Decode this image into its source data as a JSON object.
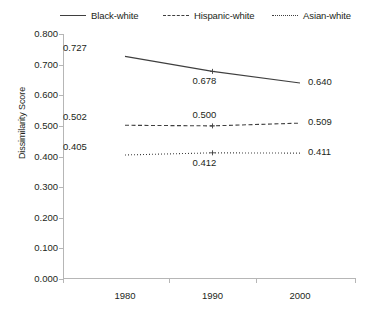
{
  "chart_data": {
    "type": "line",
    "title": "",
    "xlabel": "",
    "ylabel": "Dissimilarity Score",
    "categories": [
      "1980",
      "1990",
      "2000"
    ],
    "ylim": [
      0.0,
      0.8
    ],
    "ytick_labels": [
      "0.800",
      "0.700",
      "0.600",
      "0.500",
      "0.400",
      "0.300",
      "0.200",
      "0.100",
      "0.000"
    ],
    "ytick_values": [
      0.8,
      0.7,
      0.6,
      0.5,
      0.4,
      0.3,
      0.2,
      0.1,
      0.0
    ],
    "grid": false,
    "legend_position": "top",
    "series": [
      {
        "name": "Black-white",
        "style": "solid",
        "color": "#3f3f3f",
        "values": [
          0.727,
          0.678,
          0.64
        ],
        "labels": [
          "0.727",
          "0.678",
          "0.640"
        ]
      },
      {
        "name": "Hispanic-white",
        "style": "dashed",
        "color": "#3f3f3f",
        "values": [
          0.502,
          0.5,
          0.509
        ],
        "labels": [
          "0.502",
          "0.500",
          "0.509"
        ]
      },
      {
        "name": "Asian-white",
        "style": "dotted",
        "color": "#3f3f3f",
        "values": [
          0.405,
          0.412,
          0.411
        ],
        "labels": [
          "0.405",
          "0.412",
          "0.411"
        ]
      }
    ]
  },
  "legend": {
    "items": [
      {
        "label": "Black-white"
      },
      {
        "label": "Hispanic-white"
      },
      {
        "label": "Asian-white"
      }
    ]
  },
  "axis": {
    "y_title": "Dissimilarity Score"
  }
}
